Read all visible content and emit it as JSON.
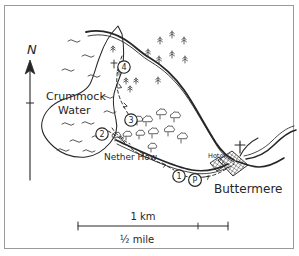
{
  "map": {
    "title": "Buttermere and Crummock Water walking route map",
    "style": "hand-drawn pen and ink sketch map",
    "frame": {
      "border_color": "#9a9a9a",
      "background_color": "#ffffff"
    },
    "ink_color": "#262626",
    "labels": {
      "lake_west": "Crummock\nWater",
      "lake_west_line1": "Crummock",
      "lake_west_line2": "Water",
      "headland": "Nether How",
      "village": "Buttermere",
      "hotel": "Hotel",
      "north": "N"
    },
    "route_markers": [
      {
        "id": "marker-1",
        "label": "1",
        "x": 179,
        "y": 176
      },
      {
        "id": "marker-2",
        "label": "2",
        "x": 102,
        "y": 134
      },
      {
        "id": "marker-3",
        "label": "3",
        "x": 131,
        "y": 120
      },
      {
        "id": "marker-4",
        "label": "4",
        "x": 124,
        "y": 67
      },
      {
        "id": "marker-parking",
        "label": "P",
        "x": 195,
        "y": 180
      }
    ],
    "symbols": {
      "parking": "P",
      "church_cross": "cross",
      "conifer_tree": "conifer",
      "broadleaf_tree": "broadleaf",
      "water_ripple": "~",
      "footpath": "dashed",
      "road": "double-line",
      "buildings": "cross-hatch"
    },
    "scale_bar": {
      "top_label": "1 km",
      "bottom_label": "½ mile",
      "x_start": 78,
      "x_end": 228,
      "y": 226,
      "tick_x": 198
    }
  }
}
